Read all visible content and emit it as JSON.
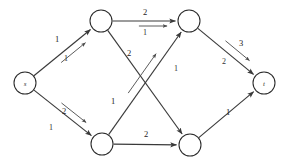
{
  "diagram": {
    "colors": {
      "edge": "#3a3a3a",
      "node_stroke": "#2a2a2a",
      "node_fill": "#ffffff",
      "text": "#222222",
      "background": "#ffffff"
    },
    "node_radius": 11,
    "nodes": [
      {
        "id": "s",
        "label": "s",
        "x": 25,
        "y": 83,
        "name": "node-s"
      },
      {
        "id": "a",
        "label": "",
        "x": 101,
        "y": 21,
        "name": "node-top-left"
      },
      {
        "id": "b",
        "label": "",
        "x": 189,
        "y": 21,
        "name": "node-top-right"
      },
      {
        "id": "c",
        "label": "",
        "x": 102,
        "y": 144,
        "name": "node-bottom-left"
      },
      {
        "id": "d",
        "label": "",
        "x": 190,
        "y": 145,
        "name": "node-bottom-right"
      },
      {
        "id": "t",
        "label": "t",
        "x": 264,
        "y": 83,
        "name": "node-t"
      }
    ],
    "edges": [
      {
        "id": "s-a",
        "from": "s",
        "to": "a",
        "capacity": "1",
        "flow": "1",
        "cap_x": 57,
        "cap_y": 39,
        "flow_x": 66,
        "flow_y": 58,
        "has_flow_arrow": true,
        "flow_offset": 7,
        "name": "edge-s-to-top-left"
      },
      {
        "id": "s-c",
        "from": "s",
        "to": "c",
        "capacity": "2",
        "flow": "1",
        "cap_x": 64,
        "cap_y": 111,
        "flow_x": 51,
        "flow_y": 127,
        "has_flow_arrow": true,
        "flow_offset": -7,
        "name": "edge-s-to-bottom-left"
      },
      {
        "id": "a-b",
        "from": "a",
        "to": "b",
        "capacity": "2",
        "flow": "1",
        "cap_x": 145,
        "cap_y": 12,
        "flow_x": 145,
        "flow_y": 32,
        "has_flow_arrow": true,
        "flow_offset": 5,
        "name": "edge-top-left-to-top-right"
      },
      {
        "id": "a-d",
        "from": "a",
        "to": "d",
        "capacity": "2",
        "flow": "",
        "cap_x": 129,
        "cap_y": 53,
        "flow_x": 0,
        "flow_y": 0,
        "has_flow_arrow": false,
        "flow_offset": 0,
        "name": "edge-top-left-to-bottom-right"
      },
      {
        "id": "c-b",
        "from": "c",
        "to": "b",
        "capacity": "1",
        "flow": "1",
        "cap_x": 113,
        "cap_y": 101,
        "flow_x": 176,
        "flow_y": 68,
        "has_flow_arrow": true,
        "flow_offset": -8,
        "name": "edge-bottom-left-to-top-right"
      },
      {
        "id": "c-d",
        "from": "c",
        "to": "d",
        "capacity": "2",
        "flow": "",
        "cap_x": 146,
        "cap_y": 134,
        "flow_x": 0,
        "flow_y": 0,
        "has_flow_arrow": false,
        "flow_offset": 0,
        "name": "edge-bottom-left-to-bottom-right"
      },
      {
        "id": "b-t",
        "from": "b",
        "to": "t",
        "capacity": "3",
        "flow": "2",
        "cap_x": 241,
        "cap_y": 43,
        "flow_x": 224,
        "flow_y": 61,
        "has_flow_arrow": true,
        "flow_offset": -8,
        "name": "edge-top-right-to-t"
      },
      {
        "id": "d-t",
        "from": "d",
        "to": "t",
        "capacity": "1",
        "flow": "",
        "cap_x": 228,
        "cap_y": 112,
        "flow_x": 0,
        "flow_y": 0,
        "has_flow_arrow": false,
        "flow_offset": 0,
        "name": "edge-bottom-right-to-t"
      }
    ]
  }
}
